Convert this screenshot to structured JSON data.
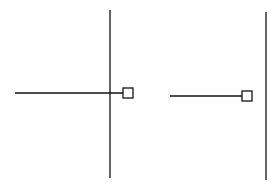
{
  "diagram": {
    "stroke_color": "#111111",
    "background": "#ffffff",
    "figures": [
      {
        "name": "left-figure",
        "vertical_line": {
          "x": 110,
          "y1": 10,
          "y2": 178
        },
        "horizontal_line": {
          "x1": 15,
          "x2": 123,
          "y": 93
        },
        "square": {
          "x": 123,
          "y": 88,
          "size": 10
        }
      },
      {
        "name": "right-figure",
        "vertical_line": {
          "x": 266,
          "y1": 12,
          "y2": 180
        },
        "horizontal_line": {
          "x1": 170,
          "x2": 242,
          "y": 96
        },
        "square": {
          "x": 242,
          "y": 91,
          "size": 10
        }
      }
    ]
  }
}
